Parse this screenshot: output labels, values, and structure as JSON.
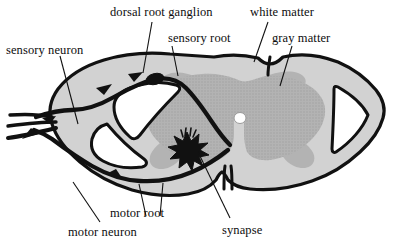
{
  "figure": {
    "background_color": "#ffffff",
    "ink_color": "#111111",
    "white_matter_fill": "#d2d2d2",
    "gray_matter_fill": "#b3b3b3",
    "cavity_fill": "#ffffff"
  },
  "labels": {
    "sensory_neuron": "sensory neuron",
    "dorsal_root_ganglion": "dorsal root ganglion",
    "sensory_root": "sensory root",
    "white_matter": "white matter",
    "gray_matter": "gray matter",
    "motor_root": "motor root",
    "motor_neuron": "motor neuron",
    "synapse": "synapse"
  },
  "structures": {
    "central_canal": "central canal",
    "dorsal_median_sulcus": "dorsal median sulcus",
    "ventral_median_fissure": "ventral median fissure",
    "synapse_marker": "synapse-starburst",
    "ganglion_swelling": "dorsal root ganglion swelling",
    "sensory_pathway_direction": "inward toward spinal cord",
    "motor_pathway_direction": "outward away from spinal cord"
  }
}
